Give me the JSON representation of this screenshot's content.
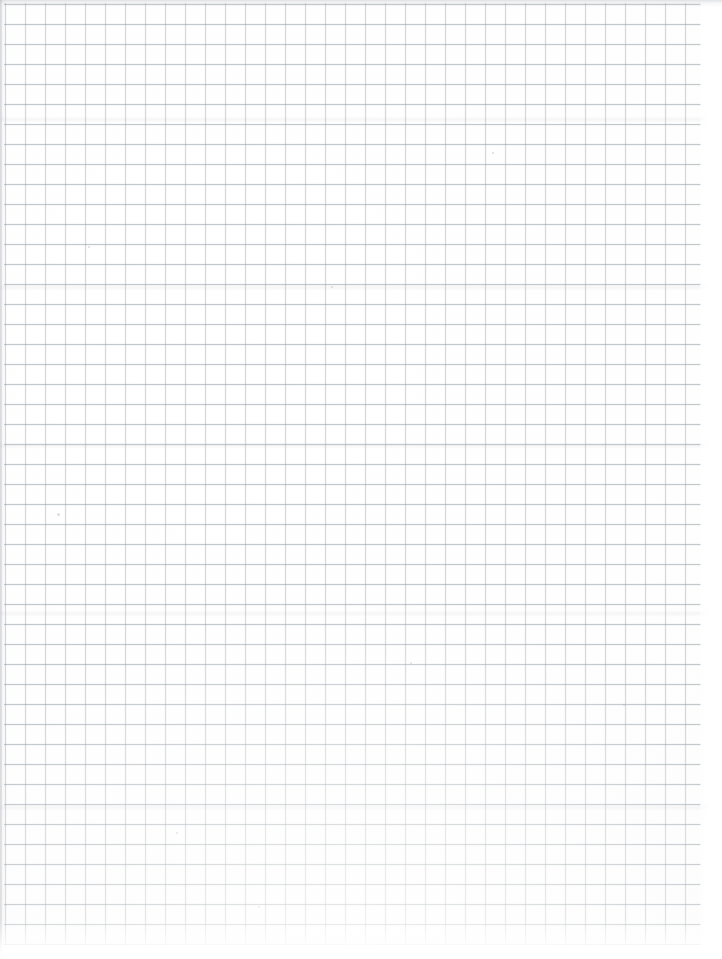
{
  "image": {
    "kind": "scanned-paper",
    "subject": "blank graph paper sheet",
    "caption": "Blank sheet of scanned quadrille / graph paper",
    "width_px": 722,
    "height_px": 959,
    "has_text": false,
    "has_handwriting": false,
    "visible_text": ""
  },
  "paper": {
    "background_color": "#fefefe",
    "paper_tone": "#fcfcfc",
    "orientation": "portrait"
  },
  "grid": {
    "type": "square quadrille",
    "cell_size_px": 20,
    "line_width_px": 1,
    "minor_line_color": "#8c96a0",
    "horizontal_line_color": "#848e98",
    "ruled_left_px": 4,
    "ruled_top_px": 3,
    "ruled_width_px": 697,
    "ruled_height_px": 942,
    "columns": 35,
    "rows": 47,
    "major_lines": false
  },
  "margins": {
    "right_margin_px": 22,
    "bottom_margin_px": 14,
    "margin_color": "#ffffff"
  },
  "scan_artifacts": {
    "top_edge_shadow": true,
    "left_edge_shadow": true,
    "bottom_fade": true,
    "edge_shadow_color": "#a8acb2",
    "speck_color": "#b0b4ba",
    "band_positions_px": [
      118,
      286,
      444,
      612,
      806
    ],
    "specks": [
      {
        "x": 57,
        "y": 513,
        "size": 3
      },
      {
        "x": 331,
        "y": 286,
        "size": 2
      },
      {
        "x": 176,
        "y": 832,
        "size": 2
      },
      {
        "x": 492,
        "y": 152,
        "size": 2
      },
      {
        "x": 623,
        "y": 704,
        "size": 2
      },
      {
        "x": 88,
        "y": 246,
        "size": 2
      },
      {
        "x": 410,
        "y": 662,
        "size": 2
      },
      {
        "x": 258,
        "y": 906,
        "size": 2
      }
    ]
  }
}
